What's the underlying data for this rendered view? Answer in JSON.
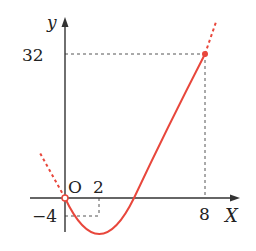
{
  "figure": {
    "type": "function-graph",
    "function": "y = x^2 - 4x",
    "axes": {
      "x_label": "X",
      "y_label": "y",
      "origin_label": "O"
    },
    "x_ticks": [
      {
        "value": 2,
        "label": "2"
      },
      {
        "value": 8,
        "label": "8"
      }
    ],
    "y_ticks": [
      {
        "value": 32,
        "label": "32"
      },
      {
        "value": -4,
        "label": "-4"
      }
    ],
    "labels": {
      "y": "y",
      "x": "X",
      "origin": "O",
      "tick_2": "2",
      "tick_8": "8",
      "tick_32": "32",
      "tick_neg4": "−4"
    },
    "highlight_points": [
      {
        "x": 8,
        "y": 32
      },
      {
        "x": 0,
        "y": 0
      }
    ],
    "vertex": {
      "x": 2,
      "y": -4
    },
    "curve_color": "#e8473c",
    "axis_color": "#333333",
    "guide_color": "#555555"
  }
}
